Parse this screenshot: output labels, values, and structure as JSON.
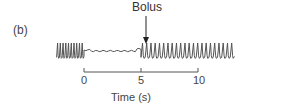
{
  "chart_data": {
    "type": "line",
    "panel_label": "(b)",
    "title": "",
    "xlabel": "Time (s)",
    "ylabel": "",
    "x_ticks": [
      0,
      5,
      10
    ],
    "x_tick_labels": [
      "0",
      "5",
      "10"
    ],
    "grid": false,
    "legend": null,
    "annotations": [
      {
        "text": "Bolus",
        "type": "arrow",
        "x": 5
      }
    ],
    "series": [
      {
        "name": "pressure trace",
        "description": "Periodic oscillation (~10 cycles) before t=0, nearly flat trace from 0 to ~5 s, then resumption of periodic oscillation (~22 cycles) after bolus at ~5 s",
        "segments": [
          {
            "phase": "oscillating",
            "x_start": -2.4,
            "x_end": 0,
            "cycles": 10
          },
          {
            "phase": "flat",
            "x_start": 0,
            "x_end": 5
          },
          {
            "phase": "oscillating",
            "x_start": 5,
            "x_end": 13.2,
            "cycles": 22
          }
        ]
      }
    ],
    "xlim": [
      -2.6,
      13.4
    ]
  },
  "labels": {
    "panel": "(b)",
    "bolus": "Bolus",
    "tick_0": "0",
    "tick_5": "5",
    "tick_10": "10",
    "xlabel": "Time (s)"
  }
}
